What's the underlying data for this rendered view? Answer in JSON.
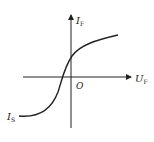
{
  "diagram": {
    "title": "",
    "y_axis": {
      "label": "I",
      "subscript": "F"
    },
    "x_axis": {
      "label": "U",
      "subscript": "F"
    },
    "origin_label": "O",
    "curve_label": {
      "label": "I",
      "subscript": "S"
    },
    "colors": {
      "stroke": "#222222",
      "background": "#ffffff"
    }
  }
}
